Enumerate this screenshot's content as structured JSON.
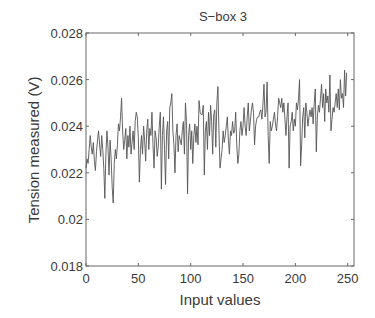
{
  "chart_data": {
    "type": "line",
    "title": "S−box 3",
    "xlabel": "Input values",
    "ylabel": "Tension measured (V)",
    "xlim": [
      0,
      256
    ],
    "ylim": [
      0.018,
      0.028
    ],
    "xticks": [
      0,
      50,
      100,
      150,
      200,
      250
    ],
    "xtick_labels": [
      "0",
      "50",
      "100",
      "150",
      "200",
      "250"
    ],
    "yticks": [
      0.018,
      0.02,
      0.022,
      0.024,
      0.026,
      0.028
    ],
    "ytick_labels": [
      "0.018",
      "0.02",
      "0.022",
      "0.024",
      "0.026",
      "0.028"
    ],
    "grid": false,
    "legend": null,
    "series": [
      {
        "name": "S-box 3",
        "color": "#555555",
        "x_start": 0,
        "x_step": 1,
        "values": [
          0.0222,
          0.0226,
          0.0224,
          0.023,
          0.0236,
          0.0231,
          0.0228,
          0.0233,
          0.0225,
          0.0221,
          0.0229,
          0.0234,
          0.0238,
          0.0232,
          0.0227,
          0.0236,
          0.023,
          0.0222,
          0.0209,
          0.0228,
          0.0238,
          0.0231,
          0.0219,
          0.0234,
          0.0226,
          0.0214,
          0.0207,
          0.0224,
          0.023,
          0.0226,
          0.0232,
          0.0241,
          0.0238,
          0.0244,
          0.0252,
          0.0238,
          0.023,
          0.0234,
          0.0239,
          0.0226,
          0.0236,
          0.0231,
          0.024,
          0.0228,
          0.0233,
          0.0238,
          0.023,
          0.0242,
          0.0246,
          0.0244,
          0.0235,
          0.0216,
          0.023,
          0.0236,
          0.0228,
          0.024,
          0.0234,
          0.0225,
          0.0238,
          0.0243,
          0.023,
          0.0239,
          0.0236,
          0.0246,
          0.0232,
          0.0222,
          0.0238,
          0.0235,
          0.0227,
          0.0231,
          0.024,
          0.0246,
          0.0213,
          0.0236,
          0.0244,
          0.023,
          0.0215,
          0.0238,
          0.0242,
          0.0226,
          0.0248,
          0.025,
          0.0254,
          0.0238,
          0.0232,
          0.022,
          0.0236,
          0.0241,
          0.0229,
          0.0236,
          0.0234,
          0.0232,
          0.0238,
          0.0242,
          0.0228,
          0.025,
          0.0242,
          0.0211,
          0.0236,
          0.0241,
          0.023,
          0.0238,
          0.0224,
          0.0236,
          0.0241,
          0.0233,
          0.024,
          0.0232,
          0.0251,
          0.0246,
          0.0245,
          0.0245,
          0.0249,
          0.0219,
          0.0238,
          0.0242,
          0.023,
          0.0246,
          0.0236,
          0.0249,
          0.0242,
          0.0228,
          0.0245,
          0.0247,
          0.0231,
          0.025,
          0.0257,
          0.0238,
          0.0222,
          0.0226,
          0.023,
          0.0238,
          0.0233,
          0.0236,
          0.024,
          0.0244,
          0.0234,
          0.0228,
          0.0238,
          0.0236,
          0.0242,
          0.0237,
          0.0238,
          0.0246,
          0.0232,
          0.0224,
          0.0228,
          0.0238,
          0.0242,
          0.0236,
          0.024,
          0.0248,
          0.024,
          0.0236,
          0.0244,
          0.025,
          0.0238,
          0.0242,
          0.0247,
          0.025,
          0.0246,
          0.0232,
          0.024,
          0.0243,
          0.0244,
          0.0244,
          0.0246,
          0.0247,
          0.0243,
          0.0249,
          0.0258,
          0.0244,
          0.0246,
          0.0259,
          0.0236,
          0.0224,
          0.0242,
          0.0238,
          0.024,
          0.0243,
          0.0246,
          0.0241,
          0.0238,
          0.0244,
          0.0252,
          0.025,
          0.0248,
          0.0252,
          0.0246,
          0.025,
          0.0243,
          0.0236,
          0.0244,
          0.025,
          0.0222,
          0.024,
          0.0242,
          0.0246,
          0.0238,
          0.0243,
          0.024,
          0.025,
          0.0247,
          0.0252,
          0.026,
          0.0223,
          0.0232,
          0.0244,
          0.0248,
          0.0235,
          0.025,
          0.0246,
          0.024,
          0.0244,
          0.0247,
          0.0244,
          0.0248,
          0.0241,
          0.025,
          0.0256,
          0.0229,
          0.0244,
          0.0249,
          0.0246,
          0.0252,
          0.0258,
          0.0248,
          0.0254,
          0.0242,
          0.0256,
          0.025,
          0.0253,
          0.0246,
          0.0262,
          0.0238,
          0.0243,
          0.0248,
          0.0246,
          0.025,
          0.0254,
          0.0248,
          0.0256,
          0.0247,
          0.026,
          0.0252,
          0.0254,
          0.0248,
          0.0264,
          0.0253,
          0.0263
        ]
      }
    ]
  },
  "plot_box": {
    "left": 86,
    "top": 33,
    "right": 354,
    "bottom": 266
  }
}
